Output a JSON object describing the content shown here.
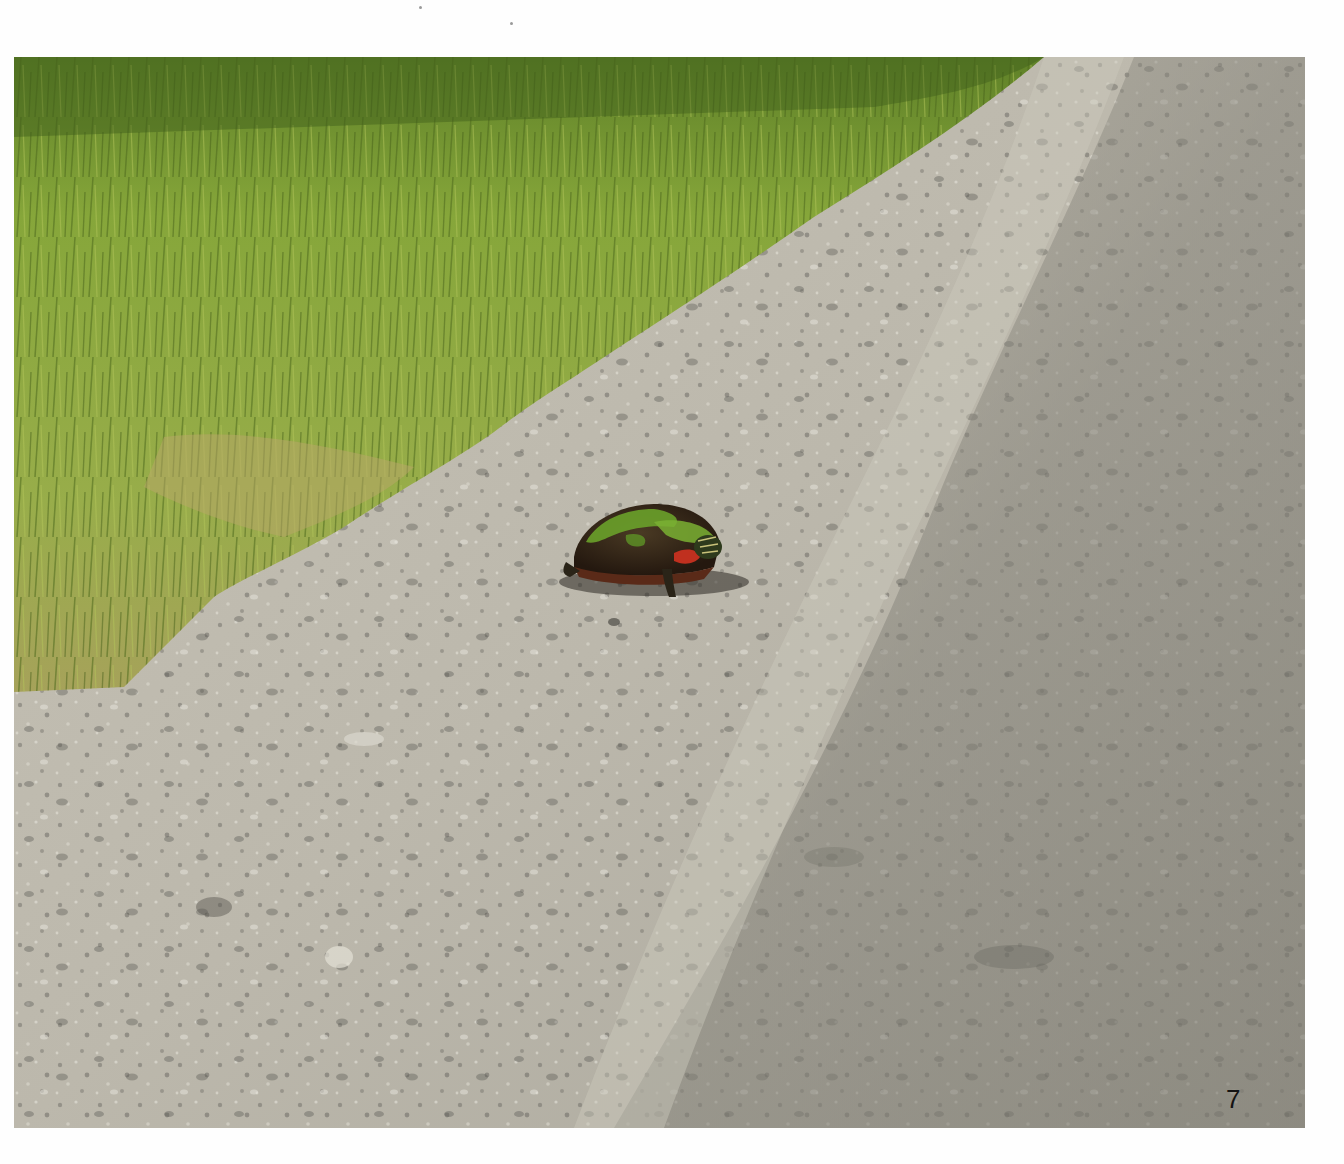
{
  "page": {
    "page_number": "7",
    "background_color": "#fefefe"
  },
  "photo": {
    "subject": "painted turtle crossing gravel road",
    "regions": [
      {
        "name": "grass",
        "color": "#8aa83a"
      },
      {
        "name": "grass-dark",
        "color": "#4f6e22"
      },
      {
        "name": "gravel-road",
        "color": "#b9b5aa"
      },
      {
        "name": "road-dark-track",
        "color": "#8d8b80"
      },
      {
        "name": "turtle-shell",
        "color": "#3a2a1c"
      },
      {
        "name": "turtle-moss",
        "color": "#6aa12a"
      },
      {
        "name": "turtle-red-markings",
        "color": "#c0301f"
      }
    ]
  }
}
